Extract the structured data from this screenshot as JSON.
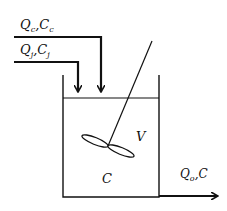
{
  "diagram": {
    "type": "stirred tank reactor schematic",
    "inlet_c": {
      "flow": "Q",
      "flow_sub": "c",
      "conc": "C",
      "conc_sub": "c",
      "sep": ","
    },
    "inlet_j": {
      "flow": "Q",
      "flow_sub": "j",
      "conc": "C",
      "conc_sub": "j",
      "sep": ","
    },
    "tank": {
      "volume_label": "V",
      "concentration_label": "C"
    },
    "outlet": {
      "flow": "Q",
      "flow_sub": "o",
      "conc": "C",
      "sep": ","
    },
    "colors": {
      "line": "#111111",
      "background": "#ffffff"
    }
  }
}
